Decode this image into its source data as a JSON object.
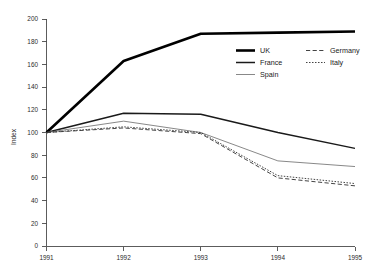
{
  "chart_data": {
    "type": "line",
    "title": "",
    "xlabel": "",
    "ylabel": "Index",
    "categories": [
      "1991",
      "1992",
      "1993",
      "1994",
      "1995"
    ],
    "x": [
      1991,
      1992,
      1993,
      1994,
      1995
    ],
    "xlim": [
      1991,
      1995
    ],
    "ylim": [
      0,
      200
    ],
    "yticks": [
      0,
      20,
      40,
      60,
      80,
      100,
      120,
      140,
      160,
      180,
      200
    ],
    "ytick_labels": [
      "0",
      "20",
      "40",
      "60",
      "80",
      "100",
      "120",
      "140",
      "160",
      "180",
      "200"
    ],
    "xticks": [
      1991,
      1992,
      1993,
      1994,
      1995
    ],
    "xtick_labels": [
      "1991",
      "1992",
      "1993",
      "1994",
      "1995"
    ],
    "grid": false,
    "legend_position": "upper-right-inside",
    "series": [
      {
        "name": "UK",
        "values": [
          100,
          163,
          187,
          188,
          189
        ],
        "color": "#000000",
        "style": "solid",
        "width": 2.6
      },
      {
        "name": "France",
        "values": [
          100,
          117,
          116,
          100,
          86
        ],
        "color": "#1a1a1a",
        "style": "solid",
        "width": 1.5
      },
      {
        "name": "Spain",
        "values": [
          100,
          110,
          100,
          75,
          70
        ],
        "color": "#7a7a7a",
        "style": "solid",
        "width": 0.9
      },
      {
        "name": "Germany",
        "values": [
          100,
          104,
          99,
          60,
          53
        ],
        "color": "#3a3a3a",
        "style": "dashed",
        "width": 0.95
      },
      {
        "name": "Italy",
        "values": [
          100,
          105,
          100,
          62,
          55
        ],
        "color": "#3a3a3a",
        "style": "dotted",
        "width": 0.95
      }
    ]
  },
  "legend": {
    "entries": [
      {
        "label": "UK",
        "column": 0,
        "row": 0
      },
      {
        "label": "France",
        "column": 0,
        "row": 1
      },
      {
        "label": "Spain",
        "column": 0,
        "row": 2
      },
      {
        "label": "Germany",
        "column": 1,
        "row": 0
      },
      {
        "label": "Italy",
        "column": 1,
        "row": 1
      }
    ]
  },
  "axes": {
    "y_title": "Index"
  }
}
